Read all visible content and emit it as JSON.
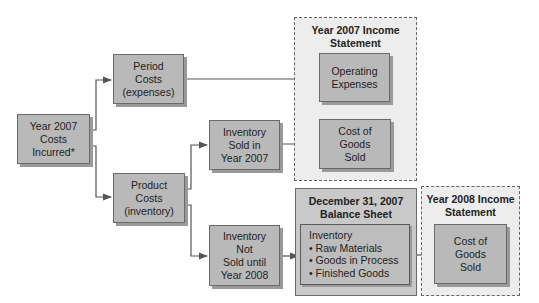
{
  "diagram": {
    "source": {
      "lines": [
        "Year 2007",
        "Costs",
        "Incurred*"
      ]
    },
    "period_costs": {
      "lines": [
        "Period",
        "Costs",
        "(expenses)"
      ]
    },
    "product_costs": {
      "lines": [
        "Product",
        "Costs",
        "(inventory)"
      ]
    },
    "inventory_sold": {
      "lines": [
        "Inventory",
        "Sold in",
        "Year 2007"
      ]
    },
    "inventory_not_sold": {
      "lines": [
        "Inventory",
        "Not",
        "Sold until",
        "Year 2008"
      ]
    },
    "income_2007": {
      "title_lines": [
        "Year 2007 Income",
        "Statement"
      ],
      "operating_expenses": {
        "lines": [
          "Operating",
          "Expenses"
        ]
      },
      "cogs": {
        "lines": [
          "Cost of",
          "Goods",
          "Sold"
        ]
      }
    },
    "balance_sheet": {
      "title_lines": [
        "December 31, 2007",
        "Balance Sheet"
      ],
      "inventory_heading": "Inventory",
      "inventory_items": [
        "• Raw Materials",
        "• Goods in Process",
        "• Finished Goods"
      ]
    },
    "income_2008": {
      "title_lines": [
        "Year 2008 Income",
        "Statement"
      ],
      "cogs": {
        "lines": [
          "Cost of",
          "Goods",
          "Sold"
        ]
      }
    }
  },
  "colors": {
    "box_fill": "#b9b9b9",
    "panel_fill": "#c9c9c9",
    "dashed_fill": "#ededed",
    "line": "#555555"
  }
}
